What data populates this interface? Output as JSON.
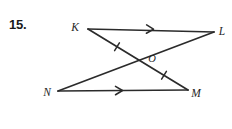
{
  "page": {
    "background_color": "#ffffff",
    "ink_color": "#2b2b2b",
    "text_color": "#1f1f1f",
    "width": 232,
    "height": 129
  },
  "problem": {
    "number_label": "15."
  },
  "figure": {
    "type": "geometry-diagram",
    "vertices": [
      {
        "name": "K",
        "label": "K",
        "x": 88,
        "y": 29,
        "label_x": 75,
        "label_y": 31
      },
      {
        "name": "L",
        "label": "L",
        "x": 214,
        "y": 32,
        "label_x": 219,
        "label_y": 35
      },
      {
        "name": "N",
        "label": "N",
        "x": 58,
        "y": 91,
        "label_x": 44,
        "label_y": 96
      },
      {
        "name": "M",
        "label": "M",
        "x": 188,
        "y": 90,
        "label_x": 192,
        "label_y": 97
      }
    ],
    "intersection": {
      "name": "O",
      "label": "O",
      "x": 140,
      "y": 58,
      "label_x": 149,
      "label_y": 62
    },
    "segments": [
      {
        "name": "KL",
        "from": "K",
        "to": "L",
        "x1": 88,
        "y1": 29,
        "x2": 214,
        "y2": 32
      },
      {
        "name": "NM",
        "from": "N",
        "to": "M",
        "x1": 58,
        "y1": 91,
        "x2": 188,
        "y2": 90
      },
      {
        "name": "KM",
        "from": "K",
        "to": "M",
        "x1": 88,
        "y1": 29,
        "x2": 188,
        "y2": 90
      },
      {
        "name": "NL",
        "from": "N",
        "to": "L",
        "x1": 58,
        "y1": 91,
        "x2": 214,
        "y2": 32
      }
    ],
    "parallel_arrow_marks": [
      {
        "name": "arrow-on-KL",
        "on_segment": "KL",
        "x": 152,
        "y": 29.2,
        "angle_deg": 1.4
      },
      {
        "name": "arrow-on-NM",
        "on_segment": "NM",
        "x": 121,
        "y": 90.5,
        "angle_deg": -0.4
      }
    ],
    "congruence_tick_marks": [
      {
        "name": "tick-on-KO",
        "on_segment": "KM",
        "x": 117,
        "y": 46.7,
        "angle_deg": 31.4
      },
      {
        "name": "tick-on-OM",
        "on_segment": "KM",
        "x": 164,
        "y": 75.3,
        "angle_deg": 31.4
      }
    ]
  }
}
